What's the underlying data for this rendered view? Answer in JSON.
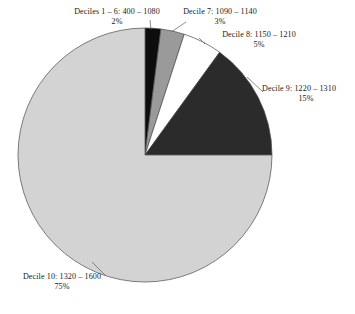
{
  "chart_data": {
    "type": "pie",
    "title": "",
    "subtitle": "",
    "xlabel": "",
    "ylabel": "",
    "legend_position": "none",
    "grid": false,
    "start_angle_deg": 0,
    "direction": "clockwise",
    "categories": [
      "Deciles 1 – 6: 400 – 1080",
      "Decile 7: 1090 – 1140",
      "Decile 8: 1150 – 1210",
      "Decile 9: 1220 – 1310",
      "Decile 10: 1320 – 1600"
    ],
    "values": [
      2,
      3,
      5,
      15,
      75
    ],
    "value_labels": [
      "2%",
      "3%",
      "5%",
      "15%",
      "75%"
    ],
    "colors": [
      "#0d0d0d",
      "#9a9a9a",
      "#ffffff",
      "#2b2b2b",
      "#d3d3d3"
    ],
    "slices": [
      {
        "name": "Deciles 1 – 6: 400 – 1080",
        "label": "Deciles 1 – 6: 400 – 1080",
        "percent": 2,
        "percent_label": "2%",
        "color": "#0d0d0d",
        "range_low": 400,
        "range_high": 1080
      },
      {
        "name": "Decile 7: 1090 – 1140",
        "label": "Decile 7: 1090 – 1140",
        "percent": 3,
        "percent_label": "3%",
        "color": "#9a9a9a",
        "range_low": 1090,
        "range_high": 1140
      },
      {
        "name": "Decile 8: 1150 – 1210",
        "label": "Decile 8: 1150 – 1210",
        "percent": 5,
        "percent_label": "5%",
        "color": "#ffffff",
        "range_low": 1150,
        "range_high": 1210
      },
      {
        "name": "Decile 9: 1220 – 1310",
        "label": "Decile 9: 1220 – 1310",
        "percent": 15,
        "percent_label": "15%",
        "color": "#2b2b2b",
        "range_low": 1220,
        "range_high": 1310
      },
      {
        "name": "Decile 10: 1320 – 1600",
        "label": "Decile 10: 1320 – 1600",
        "percent": 75,
        "percent_label": "75%",
        "color": "#d3d3d3",
        "range_low": 1320,
        "range_high": 1600
      }
    ]
  },
  "style": {
    "outline_color": "#4a4a4a",
    "leader_color": "#5a5a5a",
    "background": "#ffffff"
  }
}
